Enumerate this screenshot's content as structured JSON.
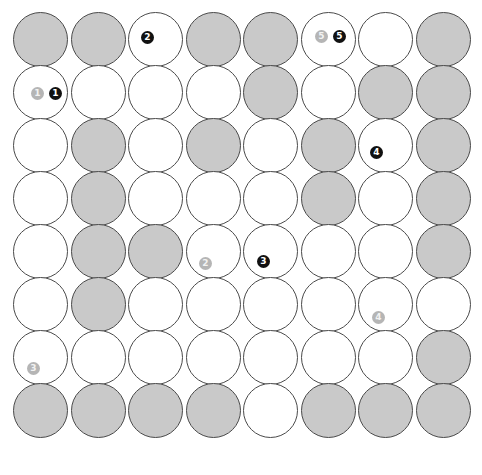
{
  "canvas": {
    "width": 482,
    "height": 475,
    "background": "#ffffff",
    "title": "Circle packing grid"
  },
  "style": {
    "circle_diameter": 55,
    "circle_stroke": "#4a4a4a",
    "filled_color": "#c9c9c9",
    "empty_color": "#ffffff",
    "marker_dark_color": "#111111",
    "marker_light_color": "#b5b5b5",
    "marker_text_color": "#ffffff"
  },
  "grid": {
    "rows": 8,
    "cols": 8,
    "origin_x": 13,
    "origin_y": 12,
    "step_x": 57.5,
    "step_y": 53,
    "fill_states": [
      [
        "filled",
        "filled",
        "empty",
        "filled",
        "filled",
        "empty",
        "empty",
        "filled"
      ],
      [
        "empty",
        "empty",
        "empty",
        "empty",
        "filled",
        "empty",
        "filled",
        "filled"
      ],
      [
        "empty",
        "filled",
        "empty",
        "filled",
        "empty",
        "filled",
        "empty",
        "filled"
      ],
      [
        "empty",
        "filled",
        "empty",
        "empty",
        "empty",
        "filled",
        "empty",
        "filled"
      ],
      [
        "empty",
        "filled",
        "filled",
        "empty",
        "empty",
        "empty",
        "empty",
        "filled"
      ],
      [
        "empty",
        "filled",
        "empty",
        "empty",
        "empty",
        "empty",
        "empty",
        "empty"
      ],
      [
        "empty",
        "empty",
        "empty",
        "empty",
        "empty",
        "empty",
        "empty",
        "filled"
      ],
      [
        "filled",
        "filled",
        "filled",
        "filled",
        "empty",
        "filled",
        "filled",
        "filled"
      ]
    ]
  },
  "markers": [
    {
      "id": "marker-2-dark",
      "label": "2",
      "shade": "dark",
      "x": 141,
      "y": 31
    },
    {
      "id": "marker-5-light",
      "label": "5",
      "shade": "light",
      "x": 315,
      "y": 30
    },
    {
      "id": "marker-5-dark",
      "label": "5",
      "shade": "dark",
      "x": 333,
      "y": 30
    },
    {
      "id": "marker-1-light",
      "label": "1",
      "shade": "light",
      "x": 31,
      "y": 87
    },
    {
      "id": "marker-1-dark",
      "label": "1",
      "shade": "dark",
      "x": 49,
      "y": 87
    },
    {
      "id": "marker-4-dark",
      "label": "4",
      "shade": "dark",
      "x": 370,
      "y": 146
    },
    {
      "id": "marker-2-light",
      "label": "2",
      "shade": "light",
      "x": 199,
      "y": 257
    },
    {
      "id": "marker-3-dark",
      "label": "3",
      "shade": "dark",
      "x": 257,
      "y": 255
    },
    {
      "id": "marker-4-light",
      "label": "4",
      "shade": "light",
      "x": 372,
      "y": 311
    },
    {
      "id": "marker-3-light",
      "label": "3",
      "shade": "light",
      "x": 27,
      "y": 362
    }
  ]
}
